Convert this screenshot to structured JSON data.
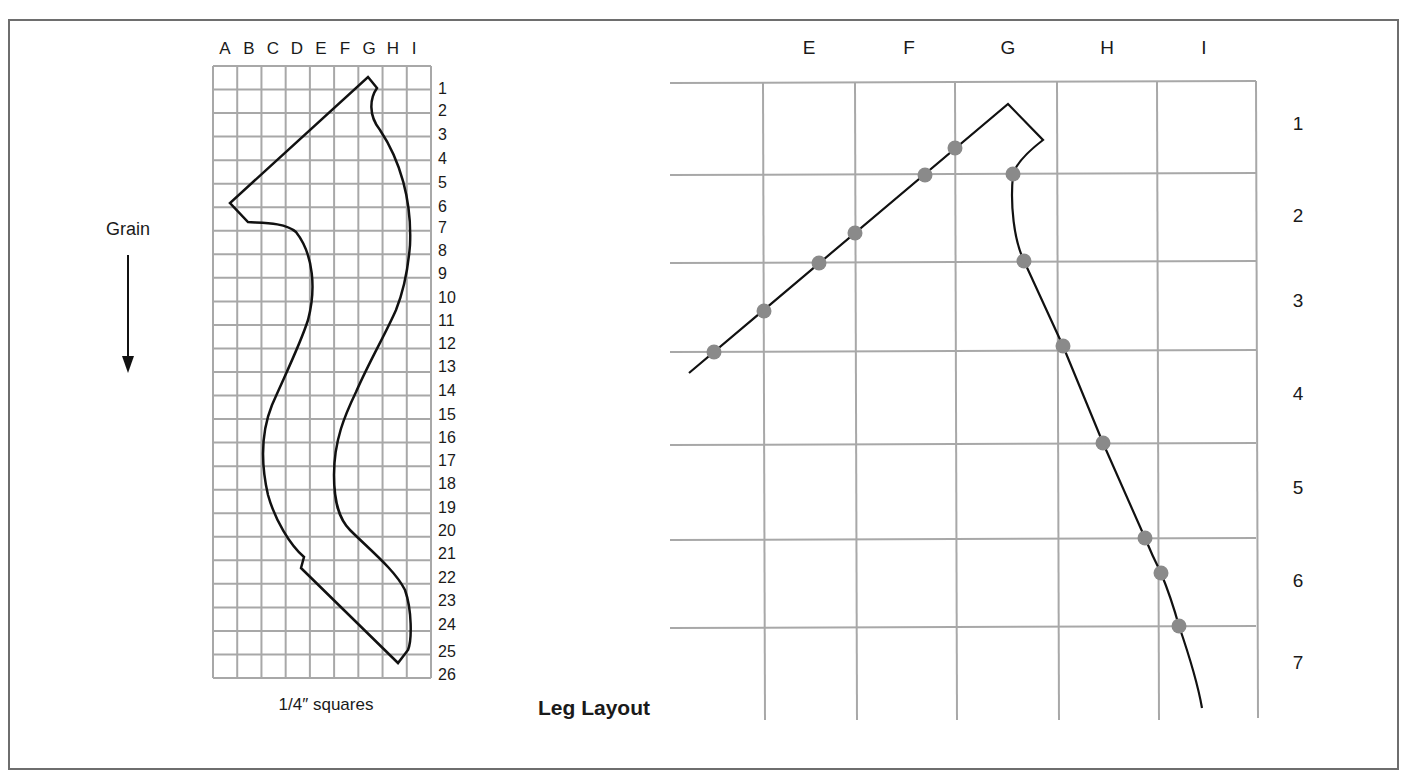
{
  "figure": {
    "title": "Leg Layout",
    "border_color": "#6e6e6e"
  },
  "pattern_grid": {
    "column_labels": [
      "A",
      "B",
      "C",
      "D",
      "E",
      "F",
      "G",
      "H",
      "I"
    ],
    "row_labels": [
      "1",
      "2",
      "3",
      "4",
      "5",
      "6",
      "7",
      "8",
      "9",
      "10",
      "11",
      "12",
      "13",
      "14",
      "15",
      "16",
      "17",
      "18",
      "19",
      "20",
      "21",
      "22",
      "23",
      "24",
      "25",
      "26"
    ],
    "caption": "1/4″ squares",
    "grid_color": "#a8a8a8"
  },
  "grain": {
    "label": "Grain",
    "arrow_direction": "down-arrow-icon"
  },
  "layout_grid": {
    "column_labels": [
      "E",
      "F",
      "G",
      "H",
      "I"
    ],
    "row_labels": [
      "1",
      "2",
      "3",
      "4",
      "5",
      "6",
      "7"
    ],
    "grid_color": "#a8a8a8",
    "point_color": "#8a8a8a",
    "points_left_edge": [
      [
        714,
        352
      ],
      [
        764,
        311
      ],
      [
        819,
        263
      ],
      [
        855,
        233
      ],
      [
        925,
        175
      ],
      [
        955,
        148
      ]
    ],
    "points_right_edge": [
      [
        1013,
        174
      ],
      [
        1024,
        261
      ],
      [
        1063,
        346
      ],
      [
        1103,
        443
      ],
      [
        1145,
        538
      ],
      [
        1161,
        573
      ],
      [
        1179,
        626
      ]
    ]
  }
}
